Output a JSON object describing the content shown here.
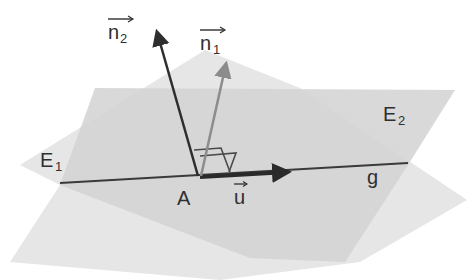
{
  "figure": {
    "type": "3d-geometry",
    "colors": {
      "background": "#ffffff",
      "plane_E1": "#e4e4e4",
      "plane_E2": "#d3d3d3",
      "overlap": "#cdcdcd",
      "line_g": "#3a3a3a",
      "vector_u": "#2a2a2a",
      "vector_n2": "#2e2e2e",
      "vector_n1": "#8c8c8c",
      "right_angle_marks": "#4a4a4a",
      "text": "#2f2f2f"
    }
  },
  "labels": {
    "plane1": {
      "base": "E",
      "sub": "1"
    },
    "plane2": {
      "base": "E",
      "sub": "2"
    },
    "line": "g",
    "point": "A",
    "vector_u": "u",
    "normal1": {
      "base": "n",
      "sub": "1"
    },
    "normal2": {
      "base": "n",
      "sub": "2"
    }
  }
}
